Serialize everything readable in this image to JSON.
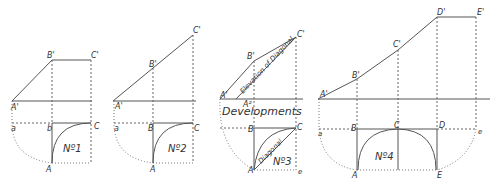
{
  "figures": [
    {
      "title": "Nº1",
      "labels": {
        "B_prime": "B'",
        "C_prime": "C'",
        "A_prime": "A'",
        "a": "a",
        "b": "b",
        "C": "C",
        "A": "A"
      }
    },
    {
      "title": "Nº2",
      "labels": {
        "B_prime": "B'",
        "C_prime": "C'",
        "A_prime": "A'",
        "a": "a",
        "B": "B",
        "C": "C",
        "A": "A"
      }
    },
    {
      "title": "Nº3",
      "labels": {
        "B_prime": "B'",
        "C_prime": "C'",
        "A_prime": "A'",
        "A2": "A²",
        "B": "B",
        "C": "C",
        "A": "A",
        "e": "e"
      },
      "annotations": {
        "elevation": "Elevation of Diagonal",
        "developments": "Developments",
        "diagonal": "Diagonal"
      }
    },
    {
      "title": "Nº4",
      "labels": {
        "A_prime": "A'",
        "B_prime": "B'",
        "C_prime": "C'",
        "D_prime": "D'",
        "E_prime": "E'",
        "a": "a",
        "B": "B",
        "C": "C",
        "D": "D",
        "e": "e",
        "A": "A",
        "E": "E"
      }
    }
  ]
}
